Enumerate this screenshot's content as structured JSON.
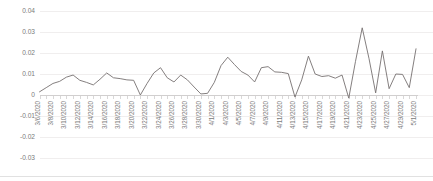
{
  "chart_data": {
    "type": "line",
    "title": "",
    "subtitle": "",
    "xlabel": "",
    "ylabel": "",
    "grid": true,
    "legend": "none",
    "ylim": [
      -0.03,
      0.04
    ],
    "yticks": [
      0.04,
      0.03,
      0.02,
      0.01,
      0,
      -0.01,
      -0.02,
      -0.03
    ],
    "ytick_labels": [
      "0.04",
      "0.03",
      "0.02",
      "0.01",
      "0",
      "-0.01",
      "-0.02",
      "-0.03"
    ],
    "xtick_labels": [
      "3/6/2020",
      "3/8/2020",
      "3/10/2020",
      "3/12/2020",
      "3/14/2020",
      "3/16/2020",
      "3/18/2020",
      "3/20/2020",
      "3/22/2020",
      "3/24/2020",
      "3/26/2020",
      "3/28/2020",
      "3/30/2020",
      "4/1/2020",
      "4/3/2020",
      "4/5/2020",
      "4/7/2020",
      "4/9/2020",
      "4/11/2020",
      "4/13/2020",
      "4/15/2020",
      "4/17/2020",
      "4/19/2020",
      "4/21/2020",
      "4/23/2020",
      "4/25/2020",
      "4/27/2020",
      "4/29/2020",
      "5/1/2020"
    ],
    "series": [
      {
        "name": "series-1",
        "color": "#767171",
        "x": [
          "3/6/2020",
          "3/7/2020",
          "3/8/2020",
          "3/9/2020",
          "3/10/2020",
          "3/11/2020",
          "3/12/2020",
          "3/13/2020",
          "3/14/2020",
          "3/15/2020",
          "3/16/2020",
          "3/17/2020",
          "3/18/2020",
          "3/19/2020",
          "3/20/2020",
          "3/21/2020",
          "3/22/2020",
          "3/23/2020",
          "3/24/2020",
          "3/25/2020",
          "3/26/2020",
          "3/27/2020",
          "3/28/2020",
          "3/29/2020",
          "3/30/2020",
          "3/31/2020",
          "4/1/2020",
          "4/2/2020",
          "4/3/2020",
          "4/4/2020",
          "4/5/2020",
          "4/6/2020",
          "4/7/2020",
          "4/8/2020",
          "4/9/2020",
          "4/10/2020",
          "4/11/2020",
          "4/12/2020",
          "4/13/2020",
          "4/14/2020",
          "4/15/2020",
          "4/16/2020",
          "4/17/2020",
          "4/18/2020",
          "4/19/2020",
          "4/20/2020",
          "4/21/2020",
          "4/22/2020",
          "4/23/2020",
          "4/24/2020",
          "4/25/2020",
          "4/26/2020",
          "4/27/2020",
          "4/28/2020",
          "4/29/2020",
          "4/30/2020",
          "5/1/2020"
        ],
        "values": [
          0.0015,
          0.0035,
          0.0055,
          0.0065,
          0.0085,
          0.0095,
          0.007,
          0.006,
          0.0048,
          0.0075,
          0.0105,
          0.0082,
          0.0078,
          0.0072,
          0.007,
          0.0,
          0.0055,
          0.0105,
          0.013,
          0.0082,
          0.0062,
          0.0095,
          0.0072,
          0.0038,
          0.0005,
          0.0008,
          0.006,
          0.014,
          0.018,
          0.0145,
          0.0112,
          0.0095,
          0.0062,
          0.013,
          0.0135,
          0.011,
          0.0108,
          0.0102,
          -0.001,
          0.0072,
          0.0185,
          0.01,
          0.0088,
          0.0092,
          0.008,
          0.0095,
          -0.0015,
          0.016,
          0.032,
          0.0175,
          0.001,
          0.021,
          0.003,
          0.01,
          0.0098,
          0.0035,
          0.022
        ]
      }
    ]
  }
}
